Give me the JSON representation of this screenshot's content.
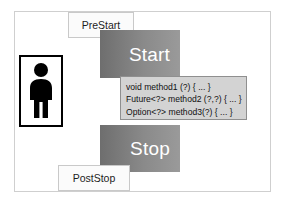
{
  "diagram": {
    "type": "lifecycle-state-diagram",
    "actor": {
      "icon": "person-actor-icon",
      "label": ""
    },
    "callouts": [
      {
        "id": "prestart",
        "label": "PreStart"
      },
      {
        "id": "poststop",
        "label": "PostStop"
      }
    ],
    "stages": [
      {
        "id": "start",
        "label": "Start"
      },
      {
        "id": "stop",
        "label": "Stop"
      }
    ],
    "code_box": {
      "lines": [
        "void method1 (?) { ... }",
        "Future<?> method2 (?,?) { ... }",
        "Option<?> method3(?) { ... }"
      ]
    },
    "colors": {
      "stage_fill_dark": "#6e6e6e",
      "stage_fill_light": "#9a9a9a",
      "stage_text": "#ffffff",
      "callout_fill": "#fbfbfb",
      "callout_border": "#c9c9c9",
      "code_fill": "#d3d3d3",
      "code_border": "#8f8f8f",
      "actor_fill": "#000000",
      "frame_border": "#cfcfcf",
      "canvas": "#ffffff"
    }
  }
}
